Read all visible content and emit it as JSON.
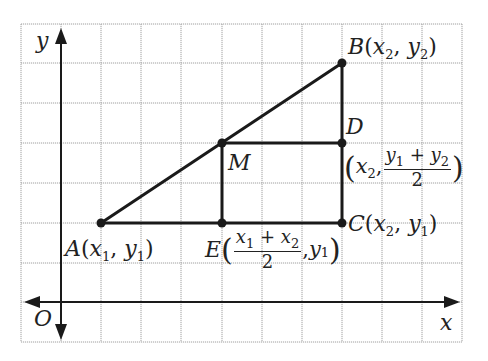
{
  "diagram": {
    "type": "coordinate-geometry-midpoint",
    "axes": {
      "x_label": "x",
      "y_label": "y",
      "origin_label": "O"
    },
    "points": [
      {
        "id": "A",
        "name": "A",
        "coords_text": "(x1, y1)"
      },
      {
        "id": "B",
        "name": "B",
        "coords_text": "(x2, y2)"
      },
      {
        "id": "C",
        "name": "C",
        "coords_text": "(x2, y1)"
      },
      {
        "id": "D",
        "name": "D",
        "coords_text": "(x2, (y1 + y2)/2)"
      },
      {
        "id": "E",
        "name": "E",
        "coords_text": "((x1 + x2)/2, y1)"
      },
      {
        "id": "M",
        "name": "M",
        "coords_text": ""
      }
    ],
    "segments": [
      "AB",
      "AC",
      "BC",
      "MD",
      "ME"
    ],
    "labels": {
      "A": "A",
      "B": "B",
      "C": "C",
      "D": "D",
      "E": "E",
      "M": "M",
      "O": "O",
      "x1": "x",
      "y1": "y",
      "x2": "x",
      "y2": "y",
      "sub1": "1",
      "sub2": "2",
      "open": "(",
      "close": ")",
      "comma": ",",
      "plus": "+",
      "two": "2"
    },
    "colors": {
      "grid": "#9a9a9a",
      "line": "#1a1a1a",
      "background": "#ffffff"
    }
  }
}
